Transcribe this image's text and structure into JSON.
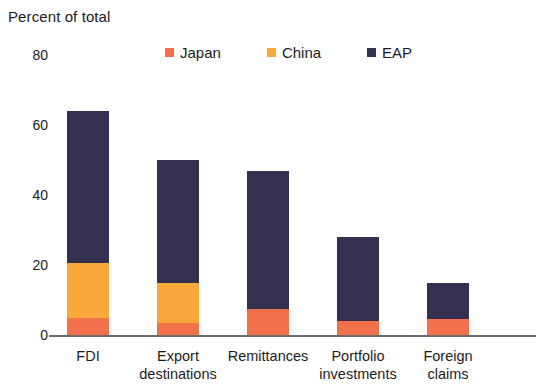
{
  "chart_data": {
    "type": "bar",
    "subtype": "stacked-column",
    "title": "Percent of total",
    "xlabel": "",
    "ylabel": "Percent of total",
    "ylim": [
      0,
      80
    ],
    "yticks": [
      0,
      20,
      40,
      60,
      80
    ],
    "ytick_labels": [
      "0",
      "20",
      "40",
      "60",
      "80"
    ],
    "grid": false,
    "legend_position": "top",
    "categories": [
      "FDI",
      "Export destinations",
      "Remittances",
      "Portfolio investments",
      "Foreign claims"
    ],
    "category_lines": [
      [
        "FDI",
        ""
      ],
      [
        "Export",
        "destinations"
      ],
      [
        "Remittances",
        ""
      ],
      [
        "Portfolio",
        "investments"
      ],
      [
        "Foreign",
        "claims"
      ]
    ],
    "series": [
      {
        "name": "Japan",
        "color": "#f2714a",
        "values": [
          5,
          3.5,
          7.5,
          4,
          4.5
        ]
      },
      {
        "name": "China",
        "color": "#f9a83c",
        "values": [
          15.5,
          11.5,
          0,
          0,
          0
        ]
      },
      {
        "name": "EAP",
        "color": "#343050",
        "values": [
          43.5,
          35,
          39.5,
          24,
          10.5
        ]
      }
    ],
    "totals": [
      64,
      50,
      47,
      28,
      15
    ]
  },
  "colors": {
    "japan": "#f2714a",
    "china": "#f9a83c",
    "eap": "#343050",
    "axis": "#6b6b6b",
    "text": "#1c1c1c",
    "background": "#ffffff"
  },
  "legend": {
    "items": [
      {
        "label": "Japan",
        "color": "#f2714a"
      },
      {
        "label": "China",
        "color": "#f9a83c"
      },
      {
        "label": "EAP",
        "color": "#343050"
      }
    ]
  }
}
